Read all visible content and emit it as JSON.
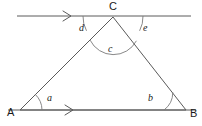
{
  "figure": {
    "type": "geometry-diagram",
    "background_color": "#ffffff",
    "line_color": "#5a5a5a",
    "arc_color": "#7a7a7a",
    "text_color": "#1a1a1a"
  },
  "vertices": [
    {
      "id": "A",
      "label": "A",
      "x": 20,
      "y": 110,
      "label_x": 7,
      "label_y": 116
    },
    {
      "id": "B",
      "label": "B",
      "x": 186,
      "y": 110,
      "label_x": 190,
      "label_y": 117
    },
    {
      "id": "C",
      "label": "C",
      "x": 113,
      "y": 17,
      "label_x": 109,
      "label_y": 10
    }
  ],
  "segments": [
    {
      "name": "side-AB",
      "from": "A",
      "to": "B"
    },
    {
      "name": "side-AC",
      "from": "A",
      "to": "C"
    },
    {
      "name": "side-BC",
      "from": "B",
      "to": "C"
    }
  ],
  "lines": [
    {
      "name": "parallel-line-through-C",
      "x1": 17,
      "y1": 16,
      "x2": 191,
      "y2": 16
    },
    {
      "name": "base-line-AB-extended",
      "x1": 8,
      "y1": 110,
      "x2": 196,
      "y2": 110
    }
  ],
  "arrow_markers": [
    {
      "name": "arrow-top-line",
      "x": 69,
      "y": 16,
      "direction": "right"
    },
    {
      "name": "arrow-bottom-line",
      "x": 71,
      "y": 110,
      "direction": "right"
    }
  ],
  "angles": [
    {
      "id": "a",
      "label": "a",
      "at_vertex": "A",
      "label_x": 47,
      "label_y": 101,
      "radius": 22
    },
    {
      "id": "b",
      "label": "b",
      "at_vertex": "B",
      "label_x": 148,
      "label_y": 101,
      "radius": 22
    },
    {
      "id": "c",
      "label": "c",
      "at_vertex": "C",
      "label_x": 108,
      "label_y": 52,
      "radius": 26
    },
    {
      "id": "d",
      "label": "d",
      "at_vertex": "C",
      "label_x": 79,
      "label_y": 31,
      "radius": 30
    },
    {
      "id": "e",
      "label": "e",
      "at_vertex": "C",
      "label_x": 143,
      "label_y": 31,
      "radius": 30
    }
  ]
}
